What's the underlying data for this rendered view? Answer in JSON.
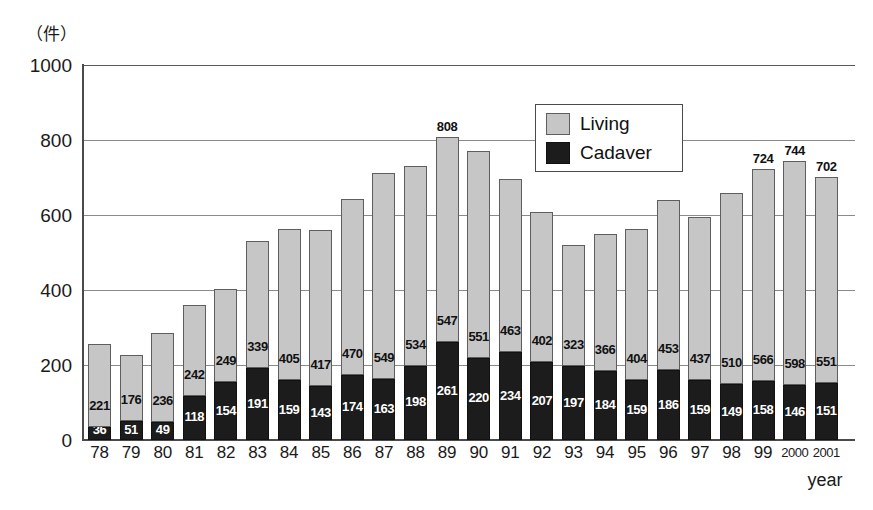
{
  "chart_data": {
    "type": "bar",
    "stacked": true,
    "title": "",
    "subtitle": "",
    "unit_label": "（件）",
    "xlabel": "year",
    "ylabel": "",
    "ylim": [
      0,
      1000
    ],
    "yticks": [
      0,
      200,
      400,
      600,
      800,
      1000
    ],
    "grid": true,
    "legend_position": "inside-top-right",
    "categories": [
      "78",
      "79",
      "80",
      "81",
      "82",
      "83",
      "84",
      "85",
      "86",
      "87",
      "88",
      "89",
      "90",
      "91",
      "92",
      "93",
      "94",
      "95",
      "96",
      "97",
      "98",
      "99",
      "2000",
      "2001"
    ],
    "series": [
      {
        "name": "Cadaver",
        "color": "#1c1c1c",
        "values": [
          36,
          51,
          49,
          118,
          154,
          191,
          159,
          143,
          174,
          163,
          198,
          261,
          220,
          234,
          207,
          197,
          184,
          159,
          186,
          159,
          149,
          158,
          146,
          151
        ]
      },
      {
        "name": "Living",
        "color": "#c6c6c6",
        "values": [
          221,
          176,
          236,
          242,
          249,
          339,
          405,
          417,
          470,
          549,
          534,
          547,
          551,
          463,
          402,
          323,
          366,
          404,
          453,
          437,
          510,
          566,
          598,
          551
        ]
      }
    ],
    "totals": [
      257,
      227,
      285,
      360,
      403,
      530,
      564,
      560,
      644,
      712,
      732,
      808,
      771,
      697,
      609,
      520,
      550,
      563,
      639,
      596,
      659,
      724,
      744,
      702
    ],
    "total_labels_shown": {
      "11": "808",
      "21": "724",
      "22": "744",
      "23": "702"
    },
    "annotations": []
  },
  "legend": {
    "items": [
      {
        "label": "Living",
        "swatch": "living-swatch",
        "color": "#c6c6c6"
      },
      {
        "label": "Cadaver",
        "swatch": "cadaver-swatch",
        "color": "#1c1c1c"
      }
    ]
  }
}
